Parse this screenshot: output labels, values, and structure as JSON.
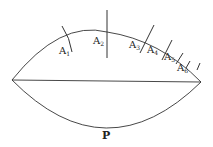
{
  "diagram": {
    "type": "lens-shaped region with subdivided upper arc",
    "labels": {
      "A1": {
        "base": "A",
        "sub": "1"
      },
      "A2": {
        "base": "A",
        "sub": "2"
      },
      "A3": {
        "base": "A",
        "sub": "3"
      },
      "A4": {
        "base": "A",
        "sub": "4"
      },
      "A5": {
        "base": "A",
        "sub": "5"
      },
      "A6": {
        "base": "A",
        "sub": "6"
      },
      "P": "P"
    },
    "colors": {
      "stroke": "#333333",
      "text": "#222222",
      "background": "#ffffff"
    }
  }
}
